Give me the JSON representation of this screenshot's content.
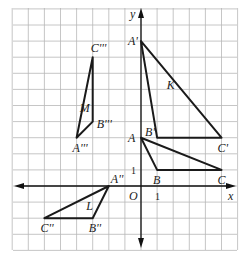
{
  "axes": {
    "x_label": "x",
    "y_label": "y",
    "origin_label": "O",
    "unit_tick_label": "1",
    "x_range": [
      -8,
      6
    ],
    "y_range": [
      -4,
      11
    ]
  },
  "triangles": [
    {
      "name": "ABC",
      "region_label": "",
      "vertices": [
        {
          "label": "A",
          "x": 0,
          "y": 3,
          "pos": "left"
        },
        {
          "label": "B",
          "x": 1,
          "y": 1,
          "pos": "below"
        },
        {
          "label": "C",
          "x": 5,
          "y": 1,
          "pos": "below"
        }
      ]
    },
    {
      "name": "K",
      "region_label": "K",
      "region_at": [
        1.6,
        6
      ],
      "vertices": [
        {
          "label": "A'",
          "x": 0,
          "y": 9,
          "pos": "left"
        },
        {
          "label": "B'",
          "x": 1,
          "y": 3,
          "pos": "upleft"
        },
        {
          "label": "C'",
          "x": 5,
          "y": 3,
          "pos": "below"
        }
      ]
    },
    {
      "name": "L",
      "region_label": "L",
      "region_at": [
        -3.4,
        -1.5
      ],
      "vertices": [
        {
          "label": "A''",
          "x": -2,
          "y": 0,
          "pos": "upright"
        },
        {
          "label": "B''",
          "x": -3,
          "y": -2,
          "pos": "below"
        },
        {
          "label": "C''",
          "x": -6,
          "y": -2,
          "pos": "below"
        }
      ]
    },
    {
      "name": "M",
      "region_label": "M",
      "region_at": [
        -3.8,
        4.6
      ],
      "vertices": [
        {
          "label": "A'''",
          "x": -4,
          "y": 3,
          "pos": "below"
        },
        {
          "label": "B'''",
          "x": -3,
          "y": 4,
          "pos": "right"
        },
        {
          "label": "C'''",
          "x": -3,
          "y": 8,
          "pos": "aboveright"
        }
      ]
    }
  ]
}
